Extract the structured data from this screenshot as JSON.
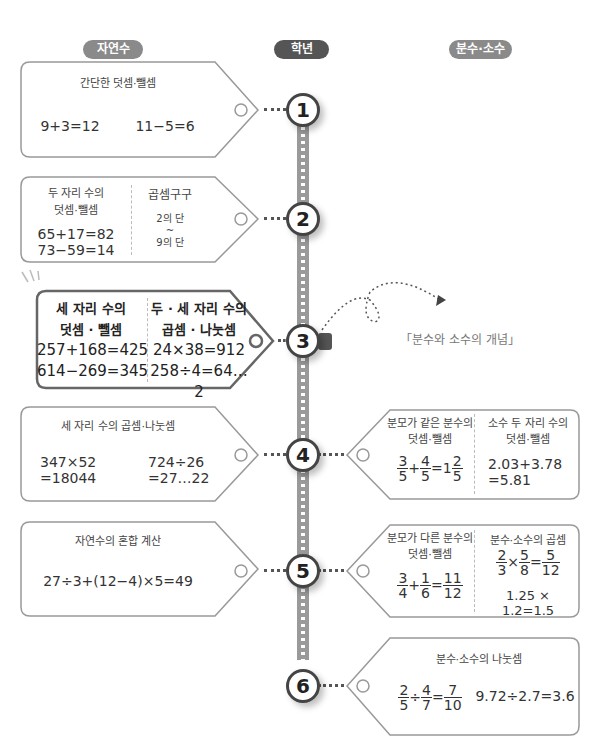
{
  "headers": {
    "natural": "자연수",
    "grade": "학년",
    "fraction": "분수·소수"
  },
  "grades": [
    "1",
    "2",
    "3",
    "4",
    "5",
    "6"
  ],
  "left_cards": [
    {
      "title": "간단한 덧셈·뺄셈",
      "eq1": "9+3=12",
      "eq2": "11−5=6"
    },
    {
      "col1_title1": "두 자리 수의",
      "col1_title2": "덧셈·뺄셈",
      "col1_eq1": "65+17=82",
      "col1_eq2": "73−59=14",
      "col2_title": "곱셈구구",
      "col2_l1": "2의 단",
      "col2_l2": "~",
      "col2_l3": "9의 단"
    },
    {
      "col1_title1": "세 자리 수의",
      "col1_title2": "덧셈 · 뺄셈",
      "col1_eq1": "257+168=425",
      "col1_eq2": "614−269=345",
      "col2_title1": "두 · 세 자리 수의",
      "col2_title2": "곱셈 · 나눗셈",
      "col2_eq1": "24×38=912",
      "col2_eq2": "258÷4=64…2"
    },
    {
      "title": "세 자리 수의 곱셈·나눗셈",
      "eq1a": "347×52",
      "eq1b": "=18044",
      "eq2a": "724÷26",
      "eq2b": "=27…22"
    },
    {
      "title": "자연수의 혼합 계산",
      "eq1": "27÷3+(12−4)×5=49"
    }
  ],
  "annotation": "「분수와 소수의 개념」",
  "right_cards": [
    {
      "col1_title1": "분모가 같은 분수의",
      "col1_title2": "덧셈·뺄셈",
      "f1n": "3",
      "f1d": "5",
      "op1": "+",
      "f2n": "4",
      "f2d": "5",
      "eqs": "=1",
      "f3n": "2",
      "f3d": "5",
      "col2_title1": "소수 두 자리 수의",
      "col2_title2": "덧셈·뺄셈",
      "col2_eq1": "2.03+3.78",
      "col2_eq2": "=5.81"
    },
    {
      "col1_title1": "분모가 다른 분수의",
      "col1_title2": "덧셈·뺄셈",
      "f1n": "3",
      "f1d": "4",
      "op1": "+",
      "f2n": "1",
      "f2d": "6",
      "eqs": "=",
      "f3n": "11",
      "f3d": "12",
      "col2_title": "분수·소수의 곱셈",
      "g1n": "2",
      "g1d": "3",
      "gop": "×",
      "g2n": "5",
      "g2d": "8",
      "geq": "=",
      "g3n": "5",
      "g3d": "12",
      "col2_eq2": "1.25 × 1.2=1.5"
    },
    {
      "title": "분수·소수의 나눗셈",
      "f1n": "2",
      "f1d": "5",
      "op1": "÷",
      "f2n": "4",
      "f2d": "7",
      "eqs": "=",
      "f3n": "7",
      "f3d": "10",
      "eq2": "9.72÷2.7=3.6"
    }
  ]
}
